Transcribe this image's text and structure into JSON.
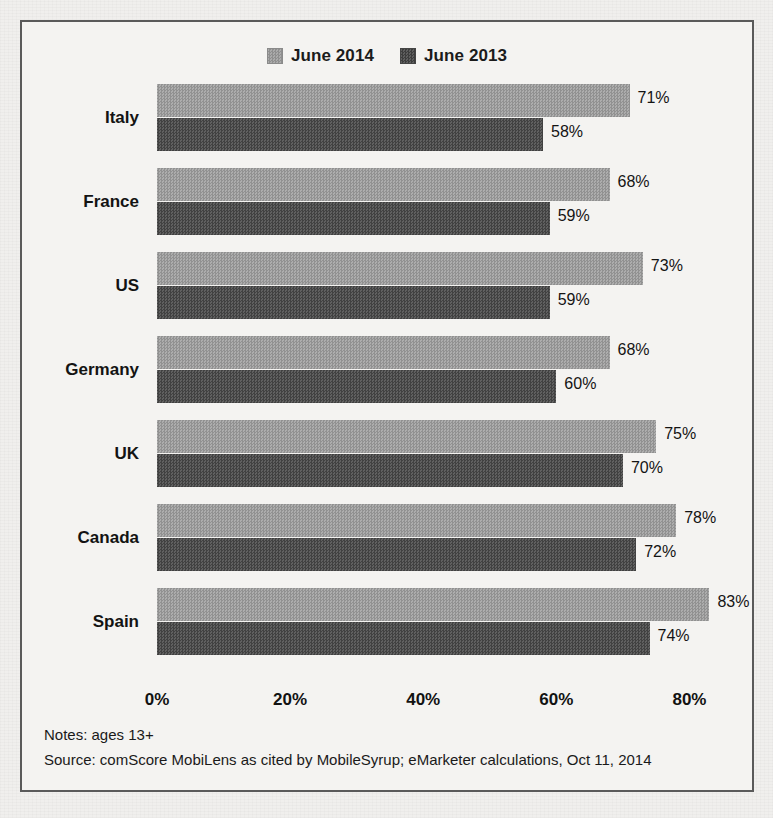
{
  "chart_data": {
    "type": "bar",
    "orientation": "horizontal",
    "title": "",
    "xlabel": "",
    "ylabel": "",
    "xlim": [
      0,
      90
    ],
    "grid": false,
    "legend_position": "top-center",
    "categories": [
      "Italy",
      "France",
      "US",
      "Germany",
      "UK",
      "Canada",
      "Spain"
    ],
    "series": [
      {
        "name": "June 2014",
        "color": "#9d9d9d",
        "values": [
          71,
          68,
          73,
          68,
          75,
          78,
          83
        ]
      },
      {
        "name": "June 2013",
        "color": "#4f4f4f",
        "values": [
          58,
          59,
          59,
          60,
          70,
          72,
          74
        ]
      }
    ],
    "value_labels": [
      {
        "category": "Italy",
        "June 2014": "71%",
        "June 2013": "58%"
      },
      {
        "category": "France",
        "June 2014": "68%",
        "June 2013": "59%"
      },
      {
        "category": "US",
        "June 2014": "73%",
        "June 2013": "59%"
      },
      {
        "category": "Germany",
        "June 2014": "68%",
        "June 2013": "60%"
      },
      {
        "category": "UK",
        "June 2014": "75%",
        "June 2013": "70%"
      },
      {
        "category": "Canada",
        "June 2014": "78%",
        "June 2013": "72%"
      },
      {
        "category": "Spain",
        "June 2014": "83%",
        "June 2013": "74%"
      }
    ],
    "xticks": [
      0,
      20,
      40,
      60,
      80
    ],
    "xticklabels": [
      "0%",
      "20%",
      "40%",
      "60%",
      "80%"
    ]
  },
  "legend": {
    "items": [
      {
        "label": "June 2014",
        "swatch": "legend-swatch-2014"
      },
      {
        "label": "June 2013",
        "swatch": "legend-swatch-2013"
      }
    ]
  },
  "footnotes": {
    "notes": "Notes: ages 13+",
    "source": "Source: comScore MobiLens as cited by MobileSyrup; eMarketer calculations, Oct 11, 2014"
  },
  "colors": {
    "series_2014": "#9d9d9d",
    "series_2013": "#4f4f4f",
    "border": "#5a5a5a",
    "background": "#f4f3f1",
    "text": "#131313"
  }
}
